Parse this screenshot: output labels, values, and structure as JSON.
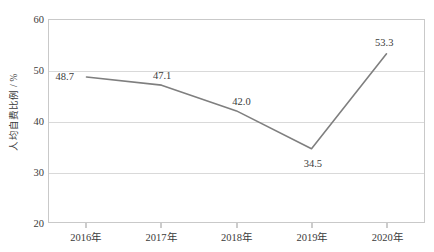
{
  "chart_data": {
    "type": "line",
    "title": "",
    "subtitle": "",
    "xlabel": "",
    "ylabel": "人均自费比例 / %",
    "categories": [
      "2016年",
      "2017年",
      "2018年",
      "2019年",
      "2020年"
    ],
    "values": [
      48.7,
      47.1,
      42.0,
      34.5,
      53.3
    ],
    "point_labels": [
      "48.7",
      "47.1",
      "42.0",
      "34.5",
      "53.3"
    ],
    "series": [
      {
        "name": "人均自费比例",
        "values": [
          48.7,
          47.1,
          42.0,
          34.5,
          53.3
        ],
        "color": "#7f7f7f"
      }
    ],
    "ylim": [
      20,
      60
    ],
    "yticks": [
      20,
      30,
      40,
      50,
      60
    ],
    "ytick_labels": [
      "20",
      "30",
      "40",
      "50",
      "60"
    ],
    "grid": true,
    "grid_axis": "y",
    "legend": false,
    "legend_position": "none",
    "annotations": [],
    "colors": {
      "line": "#7f7f7f",
      "gridline": "#d9d9d9",
      "axis_border": "#c9c9c9",
      "text": "#3b3b3b",
      "background": "#ffffff"
    }
  }
}
